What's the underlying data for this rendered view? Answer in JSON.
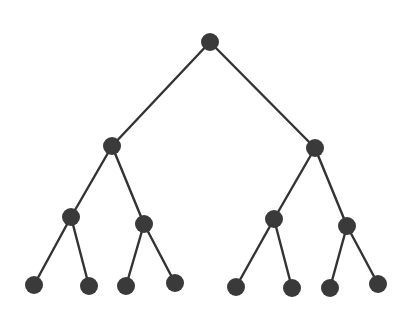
{
  "diagram": {
    "type": "binary-tree",
    "depth": 3,
    "colors": {
      "node": "#3a3a3a",
      "edge": "#333333",
      "background": "#ffffff"
    },
    "node_radius": 9,
    "nodes": [
      {
        "id": "n0",
        "level": 0,
        "x": 210,
        "y": 42
      },
      {
        "id": "n1",
        "level": 1,
        "x": 112,
        "y": 146
      },
      {
        "id": "n2",
        "level": 1,
        "x": 315,
        "y": 148
      },
      {
        "id": "n3",
        "level": 2,
        "x": 71,
        "y": 217
      },
      {
        "id": "n4",
        "level": 2,
        "x": 144,
        "y": 224
      },
      {
        "id": "n5",
        "level": 2,
        "x": 274,
        "y": 219
      },
      {
        "id": "n6",
        "level": 2,
        "x": 347,
        "y": 226
      },
      {
        "id": "n7",
        "level": 3,
        "x": 34,
        "y": 285
      },
      {
        "id": "n8",
        "level": 3,
        "x": 89,
        "y": 286
      },
      {
        "id": "n9",
        "level": 3,
        "x": 126,
        "y": 286
      },
      {
        "id": "n10",
        "level": 3,
        "x": 175,
        "y": 283
      },
      {
        "id": "n11",
        "level": 3,
        "x": 236,
        "y": 287
      },
      {
        "id": "n12",
        "level": 3,
        "x": 292,
        "y": 288
      },
      {
        "id": "n13",
        "level": 3,
        "x": 330,
        "y": 288
      },
      {
        "id": "n14",
        "level": 3,
        "x": 378,
        "y": 284
      }
    ],
    "edges": [
      [
        "n0",
        "n1"
      ],
      [
        "n0",
        "n2"
      ],
      [
        "n1",
        "n3"
      ],
      [
        "n1",
        "n4"
      ],
      [
        "n2",
        "n5"
      ],
      [
        "n2",
        "n6"
      ],
      [
        "n3",
        "n7"
      ],
      [
        "n3",
        "n8"
      ],
      [
        "n4",
        "n9"
      ],
      [
        "n4",
        "n10"
      ],
      [
        "n5",
        "n11"
      ],
      [
        "n5",
        "n12"
      ],
      [
        "n6",
        "n13"
      ],
      [
        "n6",
        "n14"
      ]
    ]
  }
}
